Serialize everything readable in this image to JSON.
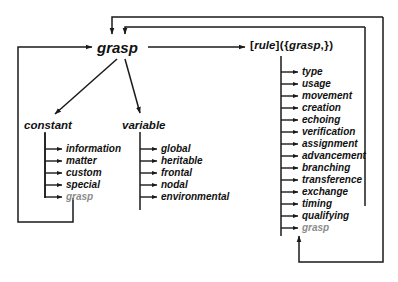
{
  "diagram": {
    "colors": {
      "ink": "#111111",
      "recursive": "#8c8c8c",
      "background": "#ffffff"
    },
    "nodes": {
      "grasp": "grasp",
      "constant": "constant",
      "variable": "variable"
    },
    "rule_expression": {
      "open_bracket": "[",
      "keyword": "rule",
      "close_bracket": "]",
      "open_paren": "(",
      "open_brace": "{",
      "argument": "grasp",
      "comma": ",",
      "close_brace": "}",
      "close_paren": ")"
    },
    "branches": [
      {
        "name": "constant",
        "label": "constant",
        "leaves": [
          {
            "label": "information",
            "recursive": false
          },
          {
            "label": "matter",
            "recursive": false
          },
          {
            "label": "custom",
            "recursive": false
          },
          {
            "label": "special",
            "recursive": false
          },
          {
            "label": "grasp",
            "recursive": true
          }
        ]
      },
      {
        "name": "variable",
        "label": "variable",
        "leaves": [
          {
            "label": "global",
            "recursive": false
          },
          {
            "label": "heritable",
            "recursive": false
          },
          {
            "label": "frontal",
            "recursive": false
          },
          {
            "label": "nodal",
            "recursive": false
          },
          {
            "label": "environmental",
            "recursive": false
          }
        ]
      },
      {
        "name": "rule",
        "label": "rule",
        "leaves": [
          {
            "label": "type",
            "recursive": false
          },
          {
            "label": "usage",
            "recursive": false
          },
          {
            "label": "movement",
            "recursive": false
          },
          {
            "label": "creation",
            "recursive": false
          },
          {
            "label": "echoing",
            "recursive": false
          },
          {
            "label": "verification",
            "recursive": false
          },
          {
            "label": "assignment",
            "recursive": false
          },
          {
            "label": "advancement",
            "recursive": false
          },
          {
            "label": "branching",
            "recursive": false
          },
          {
            "label": "transference",
            "recursive": false
          },
          {
            "label": "exchange",
            "recursive": false
          },
          {
            "label": "timing",
            "recursive": false
          },
          {
            "label": "qualifying",
            "recursive": false
          },
          {
            "label": "grasp",
            "recursive": true
          }
        ]
      }
    ]
  }
}
